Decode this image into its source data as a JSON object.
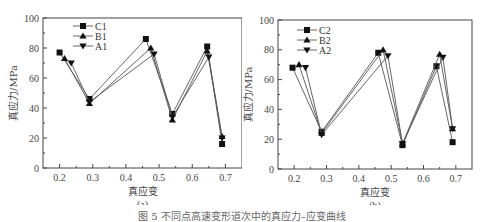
{
  "chart_data": [
    {
      "type": "line",
      "panel_label": "(a)",
      "xlabel": "真应变",
      "ylabel": "真应力/MPa",
      "xlim": [
        0.15,
        0.75
      ],
      "ylim": [
        0,
        100
      ],
      "xticks": [
        "0.2",
        "0.3",
        "0.4",
        "0.5",
        "0.6",
        "0.7"
      ],
      "yticks": [
        "0",
        "20",
        "40",
        "60",
        "80",
        "100"
      ],
      "grid": false,
      "legend_position": "upper-left",
      "series": [
        {
          "name": "C1",
          "marker": "square",
          "x": [
            0.2,
            0.29,
            0.46,
            0.54,
            0.645,
            0.69
          ],
          "y": [
            77,
            46,
            86,
            36,
            81,
            16
          ]
        },
        {
          "name": "B1",
          "marker": "triangle-up",
          "x": [
            0.215,
            0.29,
            0.475,
            0.54,
            0.645,
            0.69
          ],
          "y": [
            73,
            43,
            80,
            32,
            78,
            21
          ]
        },
        {
          "name": "A1",
          "marker": "triangle-down",
          "x": [
            0.235,
            0.29,
            0.485,
            0.54,
            0.65,
            0.69
          ],
          "y": [
            70,
            44,
            76,
            34,
            74,
            20
          ]
        }
      ]
    },
    {
      "type": "line",
      "panel_label": "(b)",
      "xlabel": "真应变",
      "ylabel": "真应力/MPa",
      "xlim": [
        0.15,
        0.75
      ],
      "ylim": [
        0,
        100
      ],
      "xticks": [
        "0.2",
        "0.3",
        "0.4",
        "0.5",
        "0.6",
        "0.7"
      ],
      "yticks": [
        "0",
        "20",
        "40",
        "60",
        "80",
        "100"
      ],
      "grid": false,
      "legend_position": "upper-left",
      "series": [
        {
          "name": "C2",
          "marker": "square",
          "x": [
            0.195,
            0.285,
            0.46,
            0.535,
            0.64,
            0.69
          ],
          "y": [
            68,
            25,
            78,
            16,
            69,
            18
          ]
        },
        {
          "name": "B2",
          "marker": "triangle-up",
          "x": [
            0.215,
            0.285,
            0.475,
            0.535,
            0.65,
            0.69
          ],
          "y": [
            70,
            24,
            80,
            17,
            77,
            27
          ]
        },
        {
          "name": "A2",
          "marker": "triangle-down",
          "x": [
            0.235,
            0.285,
            0.49,
            0.535,
            0.66,
            0.69
          ],
          "y": [
            68,
            23,
            76,
            17,
            75,
            27
          ]
        }
      ]
    }
  ],
  "caption": "图 5  不同点高速变形道次中的真应力–应变曲线",
  "colors": {
    "line": "#555555",
    "marker": "#111111",
    "axis": "#444444"
  }
}
